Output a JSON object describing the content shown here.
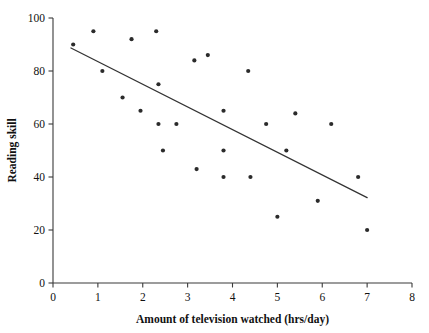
{
  "chart_data": {
    "type": "scatter",
    "title": "",
    "xlabel": "Amount of television watched (hrs/day)",
    "ylabel": "Reading skill",
    "xlim": [
      0,
      8
    ],
    "ylim": [
      0,
      100
    ],
    "xticks": [
      0,
      1,
      2,
      3,
      4,
      5,
      6,
      7,
      8
    ],
    "yticks": [
      0,
      20,
      40,
      60,
      80,
      100
    ],
    "xtick_labels": [
      "0",
      "1",
      "2",
      "3",
      "4",
      "5",
      "6",
      "7",
      "8"
    ],
    "ytick_labels": [
      "0",
      "20",
      "40",
      "60",
      "80",
      "100"
    ],
    "grid": false,
    "legend": false,
    "points": [
      {
        "x": 0.45,
        "y": 90
      },
      {
        "x": 0.9,
        "y": 95
      },
      {
        "x": 1.1,
        "y": 80
      },
      {
        "x": 1.55,
        "y": 70
      },
      {
        "x": 1.75,
        "y": 92
      },
      {
        "x": 1.95,
        "y": 65
      },
      {
        "x": 2.3,
        "y": 95
      },
      {
        "x": 2.35,
        "y": 75
      },
      {
        "x": 2.35,
        "y": 60
      },
      {
        "x": 2.45,
        "y": 50
      },
      {
        "x": 2.75,
        "y": 60
      },
      {
        "x": 3.15,
        "y": 84
      },
      {
        "x": 3.2,
        "y": 43
      },
      {
        "x": 3.45,
        "y": 86
      },
      {
        "x": 3.8,
        "y": 65
      },
      {
        "x": 3.8,
        "y": 50
      },
      {
        "x": 3.8,
        "y": 40
      },
      {
        "x": 4.35,
        "y": 80
      },
      {
        "x": 4.4,
        "y": 40
      },
      {
        "x": 4.75,
        "y": 60
      },
      {
        "x": 5.0,
        "y": 25
      },
      {
        "x": 5.2,
        "y": 50
      },
      {
        "x": 5.4,
        "y": 64
      },
      {
        "x": 5.9,
        "y": 31
      },
      {
        "x": 6.2,
        "y": 60
      },
      {
        "x": 6.8,
        "y": 40
      },
      {
        "x": 7.0,
        "y": 20
      }
    ],
    "fit_line": {
      "x0": 0.4,
      "y0": 88.7,
      "x1": 7.0,
      "y1": 32.2
    },
    "colors": {
      "point": "#2b2b2b",
      "line": "#333333",
      "axis": "#3a3a3a",
      "text": "#111111",
      "background": "#ffffff"
    }
  }
}
